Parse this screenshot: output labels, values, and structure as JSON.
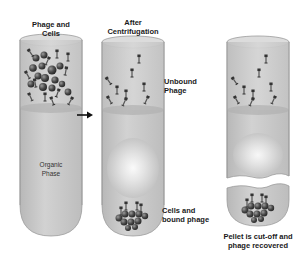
{
  "tubes": [
    {
      "id": "before",
      "title_line1": "Phage and",
      "title_line2": "Cells",
      "inner_line1": "Organic",
      "inner_line2": "Phase"
    },
    {
      "id": "after",
      "title_line1": "After",
      "title_line2": "Centrifugation"
    },
    {
      "id": "cut",
      "caption_line1": "Pellet is cut-off and",
      "caption_line2": "phage recovered"
    }
  ],
  "annotations": {
    "unbound_line1": "Unbound",
    "unbound_line2": "Phage",
    "bound_line1": "Cells and",
    "bound_line2": "bound phage"
  },
  "colors": {
    "tube_fill": "#c9c9c9",
    "tube_stroke": "#8a8a8a",
    "liquid_top": "#b5b5b5",
    "cell": "#4a4a4a",
    "phage": "#3a3a3a",
    "arrow": "#111111"
  }
}
